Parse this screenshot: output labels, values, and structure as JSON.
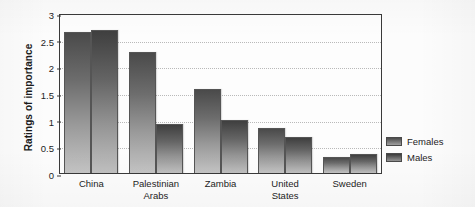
{
  "chart_data": {
    "type": "bar",
    "title": "",
    "xlabel": "",
    "ylabel": "Ratings of importance",
    "categories": [
      "China",
      "Palestinian Arabs",
      "Zambia",
      "United States",
      "Sweden"
    ],
    "category_lines": [
      [
        "China"
      ],
      [
        "Palestinian",
        "Arabs"
      ],
      [
        "Zambia"
      ],
      [
        "United",
        "States"
      ],
      [
        "Sweden"
      ]
    ],
    "series": [
      {
        "name": "Females",
        "values": [
          2.64,
          2.27,
          1.58,
          0.85,
          0.3
        ]
      },
      {
        "name": "Males",
        "values": [
          2.68,
          0.92,
          1.0,
          0.68,
          0.36
        ]
      }
    ],
    "ylim": [
      0,
      3
    ],
    "yticks": [
      "0",
      "0.5",
      "1",
      "1.5",
      "2",
      "2.5",
      "3"
    ],
    "ytick_values": [
      0,
      0.5,
      1,
      1.5,
      2,
      2.5,
      3
    ],
    "grid": true,
    "grid_style": "dotted-horizontal",
    "legend_position": "right",
    "colors": {
      "females": "#6d6d6d",
      "males": "#5e5e5e",
      "frame": "#3a3a3a",
      "grid": "#b9b9b9",
      "background": "#fcfcfc",
      "text": "#1d1d1d"
    }
  },
  "legend": {
    "items": [
      {
        "label": "Females"
      },
      {
        "label": "Males"
      }
    ]
  }
}
